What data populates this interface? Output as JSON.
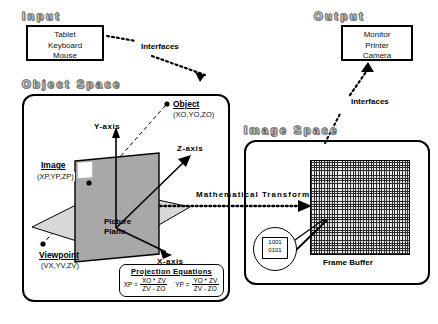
{
  "input": {
    "heading": "Input",
    "devices": [
      "Tablet",
      "Keyboard",
      "Mouse"
    ],
    "interfaces_label": "Interfaces"
  },
  "output": {
    "heading": "Output",
    "devices": [
      "Monitor",
      "Printer",
      "Camera"
    ],
    "interfaces_label": "Interfaces"
  },
  "object_space": {
    "heading": "Object Space",
    "object": {
      "label": "Object",
      "coords": "(XO,YO,ZO)"
    },
    "image": {
      "label": "Image",
      "coords": "(XP,YP,ZP)"
    },
    "viewpoint": {
      "label": "Viewpoint",
      "coords": "(VX,YV,ZV)"
    },
    "picture_plane": {
      "line1": "Picture",
      "line2": "Plane"
    },
    "axes": {
      "y": "Y-axis",
      "z": "Z-axis",
      "x": "X-axis"
    },
    "equations": {
      "title": "Projection  Equations",
      "items": [
        {
          "lhs": "XP =",
          "numerator": "XO * ZV",
          "denominator": "ZV - ZO"
        },
        {
          "lhs": "YP =",
          "numerator": "YO * ZV",
          "denominator": "ZV - ZO"
        }
      ]
    }
  },
  "image_space": {
    "heading": "Image Space",
    "frame_buffer_label": "Frame  Buffer",
    "magnifier_bits": [
      "1001",
      "0101"
    ]
  },
  "transform_arrow": {
    "label": "Mathematical  Transformations"
  },
  "colors": {
    "ink": "#000000",
    "plane_fill": "#a8a8a8",
    "floor_fill": "#d8d8d8",
    "grid_dark": "#2b2b2b",
    "grid_light": "#e9e9e9"
  }
}
